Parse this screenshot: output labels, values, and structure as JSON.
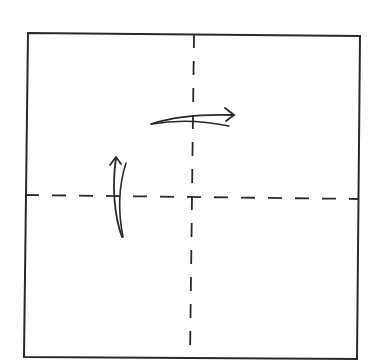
{
  "diagram": {
    "title": "Square paper with center crease lines and fold arrows",
    "stroke_color": "#2a2a2a",
    "background_color": "#ffffff",
    "paper": {
      "corners": {
        "top_left": [
          28,
          33
        ],
        "top_right": [
          360,
          36
        ],
        "bottom_right": [
          357,
          359
        ],
        "bottom_left": [
          24,
          357
        ]
      }
    },
    "crease_lines": [
      {
        "name": "vertical-crease",
        "type": "valley-fold-dashed",
        "from": [
          194,
          33
        ],
        "to": [
          190,
          359
        ]
      },
      {
        "name": "horizontal-crease",
        "type": "valley-fold-dashed",
        "from": [
          24,
          195
        ],
        "to": [
          360,
          199
        ]
      }
    ],
    "arrows": [
      {
        "name": "fold-right-arrow",
        "direction": "right",
        "icon": "curved-arrow-right"
      },
      {
        "name": "fold-up-arrow",
        "direction": "up",
        "icon": "curved-arrow-up"
      }
    ]
  }
}
